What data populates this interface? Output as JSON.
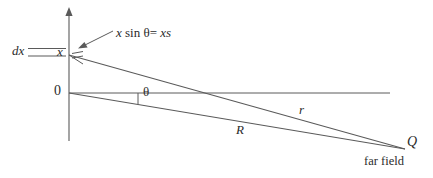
{
  "figure": {
    "kind": "geometry-diagram",
    "background_color": "#ffffff",
    "line_color": "#5a5a5a",
    "text_color": "#2b2b2b"
  },
  "labels": {
    "dx": "dx",
    "x": "x",
    "origin": "0",
    "theta": "θ",
    "R": "R",
    "r": "r",
    "Q": "Q",
    "far_field": "far field"
  },
  "annotation": {
    "path_difference_prefix": "x",
    "path_difference_sin": "sin",
    "path_difference_theta": "θ",
    "path_difference_equals": "=",
    "path_difference_result_x": "x",
    "path_difference_result_s": "s",
    "full_text": "x sin θ = x s"
  },
  "geometry": {
    "origin": {
      "x": 69,
      "y": 93
    },
    "source_point": {
      "x": 69,
      "y": 55
    },
    "far_field_point": {
      "x": 405,
      "y": 149
    },
    "axis_top": {
      "x": 69,
      "y": 8
    },
    "axis_bottom": {
      "x": 69,
      "y": 141
    },
    "horizontal_reference_end": {
      "x": 390,
      "y": 93
    },
    "slab_line_left": 28,
    "slab_line_right": 66,
    "slab_line_top_y": 48,
    "slab_line_bottom_y": 56,
    "theta_tick_x": 138,
    "perpendicular_foot": {
      "x": 82,
      "y": 63
    }
  }
}
